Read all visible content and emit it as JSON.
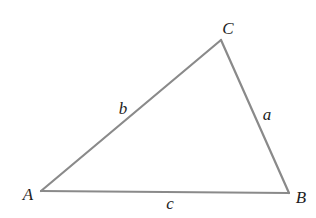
{
  "diagram": {
    "type": "triangle",
    "stroke_color": "#8a8a8a",
    "stroke_width": 2.2,
    "label_color": "#1e1e1e",
    "vertices": [
      {
        "id": "A",
        "label": "A",
        "x": 41,
        "y": 191,
        "label_x": 28,
        "label_y": 194
      },
      {
        "id": "B",
        "label": "B",
        "x": 289,
        "y": 193,
        "label_x": 301,
        "label_y": 197
      },
      {
        "id": "C",
        "label": "C",
        "x": 221,
        "y": 40,
        "label_x": 228,
        "label_y": 28
      }
    ],
    "sides": [
      {
        "id": "a",
        "label": "a",
        "from": "B",
        "to": "C",
        "label_x": 267,
        "label_y": 114
      },
      {
        "id": "b",
        "label": "b",
        "from": "A",
        "to": "C",
        "label_x": 123,
        "label_y": 108
      },
      {
        "id": "c",
        "label": "c",
        "from": "A",
        "to": "B",
        "label_x": 170,
        "label_y": 203
      }
    ]
  }
}
